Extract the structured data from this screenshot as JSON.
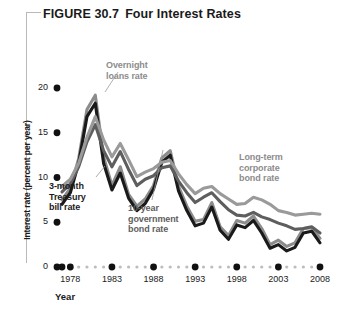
{
  "figure": {
    "number_label": "FIGURE 30.7",
    "title": "Four Interest Rates"
  },
  "axes": {
    "y_title": "Interest rate (percent per year)",
    "x_title": "Year",
    "y_ticks": [
      "0",
      "5",
      "10",
      "15",
      "20"
    ],
    "x_ticks": [
      "1978",
      "1983",
      "1988",
      "1993",
      "1998",
      "2003",
      "2008"
    ]
  },
  "annotations": {
    "overnight": "Overnight\nloans rate",
    "overnight_line1": "Overnight",
    "overnight_line2": "loans rate",
    "tbill_line1": "3-month",
    "tbill_line2": "Treasury",
    "tbill_line3": "bill rate",
    "tenyear_line1": "10-year",
    "tenyear_line2": "government",
    "tenyear_line3": "bond rate",
    "corporate_line1": "Long-term",
    "corporate_line2": "corporate",
    "corporate_line3": "bond rate"
  },
  "colors": {
    "overnight": "#8c8c8c",
    "tbill": "#1a1a1a",
    "tenyear": "#5e5e5e",
    "corporate": "#9a9a9a",
    "axis_dot": "#111111",
    "minor_dot": "#bdbdbd",
    "bracket": "#b9b9b9",
    "background": "#ffffff"
  },
  "chart_data": {
    "type": "line",
    "title": "Four Interest Rates",
    "xlabel": "Year",
    "ylabel": "Interest rate (percent per year)",
    "xlim": [
      1977,
      2009
    ],
    "ylim": [
      0,
      21
    ],
    "grid": false,
    "legend": "inline-annotations",
    "x": [
      1977,
      1978,
      1979,
      1980,
      1981,
      1982,
      1983,
      1984,
      1985,
      1986,
      1987,
      1988,
      1989,
      1990,
      1991,
      1992,
      1993,
      1994,
      1995,
      1996,
      1997,
      1998,
      1999,
      2000,
      2001,
      2002,
      2003,
      2004,
      2005,
      2006,
      2007,
      2008
    ],
    "series": [
      {
        "name": "Overnight loans rate",
        "color": "#8c8c8c",
        "values": [
          7.5,
          8.8,
          12.1,
          17.6,
          19.2,
          12.3,
          9.1,
          11.2,
          8.1,
          6.8,
          7.6,
          9.1,
          12.2,
          13.0,
          9.0,
          6.8,
          5.1,
          5.3,
          7.2,
          4.5,
          3.5,
          5.2,
          4.9,
          5.7,
          4.3,
          2.5,
          3.0,
          2.3,
          2.7,
          4.3,
          4.4,
          3.2
        ]
      },
      {
        "name": "3-month Treasury bill rate",
        "color": "#1a1a1a",
        "values": [
          7.0,
          8.3,
          11.6,
          16.8,
          18.3,
          11.6,
          8.6,
          10.5,
          7.7,
          6.3,
          7.1,
          8.7,
          11.7,
          12.5,
          8.5,
          6.3,
          4.6,
          4.9,
          6.7,
          4.1,
          3.1,
          4.7,
          4.4,
          5.2,
          3.8,
          2.1,
          2.5,
          1.8,
          2.2,
          3.8,
          4.0,
          2.7
        ]
      },
      {
        "name": "10-year government bond rate",
        "color": "#5e5e5e",
        "values": [
          8.4,
          9.3,
          11.2,
          14.0,
          15.9,
          13.0,
          11.2,
          12.9,
          10.9,
          9.1,
          9.8,
          10.2,
          11.1,
          11.3,
          9.6,
          8.3,
          7.2,
          7.8,
          8.3,
          7.3,
          6.4,
          5.8,
          5.7,
          6.1,
          5.6,
          5.3,
          4.9,
          4.6,
          4.2,
          4.3,
          4.5,
          3.8
        ]
      },
      {
        "name": "Long-term corporate bond rate",
        "color": "#9a9a9a",
        "values": [
          9.0,
          9.8,
          11.6,
          14.5,
          16.8,
          14.2,
          12.3,
          13.8,
          12.0,
          10.1,
          10.6,
          11.0,
          11.7,
          11.9,
          10.4,
          9.2,
          8.2,
          8.8,
          9.0,
          8.2,
          7.6,
          7.0,
          7.1,
          7.8,
          7.5,
          7.0,
          6.3,
          6.1,
          5.8,
          5.9,
          6.0,
          5.9
        ]
      }
    ]
  }
}
